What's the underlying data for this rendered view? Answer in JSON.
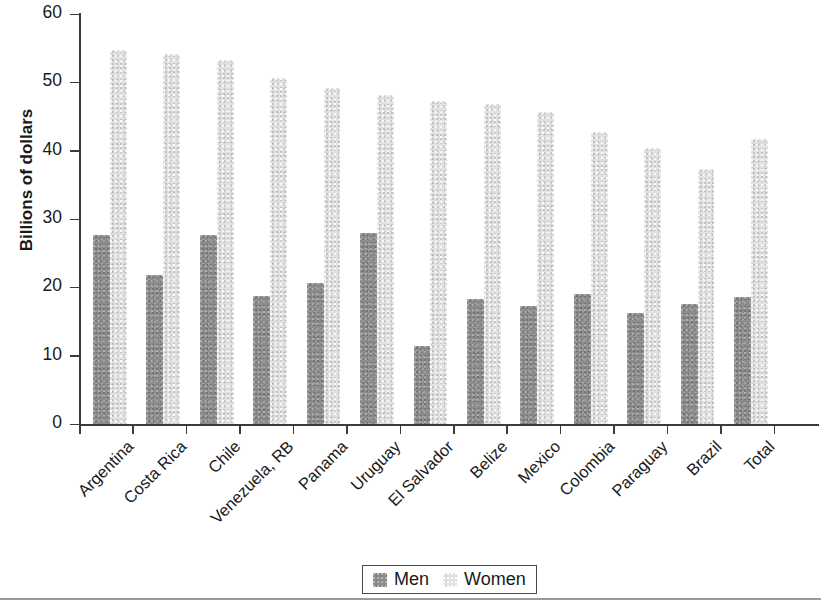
{
  "chart_data": {
    "type": "bar",
    "title": "",
    "xlabel": "",
    "ylabel": "Billions of dollars",
    "ylim": [
      0,
      60
    ],
    "yticks": [
      0,
      10,
      20,
      30,
      40,
      50,
      60
    ],
    "grid": false,
    "legend_position": "bottom",
    "categories": [
      "Argentina",
      "Costa Rica",
      "Chile",
      "Venezuela, RB",
      "Panama",
      "Uruguay",
      "El Salvador",
      "Belize",
      "Mexico",
      "Colombia",
      "Paraguay",
      "Brazil",
      "Total"
    ],
    "series": [
      {
        "name": "Men",
        "color": "#8c8c8c",
        "values": [
          27.6,
          21.8,
          27.6,
          18.8,
          20.7,
          28.0,
          11.4,
          18.3,
          17.3,
          19.0,
          16.2,
          17.5,
          18.6
        ]
      },
      {
        "name": "Women",
        "color": "#e2e2e2",
        "values": [
          54.7,
          54.1,
          53.2,
          50.7,
          49.1,
          48.1,
          47.2,
          46.9,
          45.6,
          42.7,
          40.4,
          37.3,
          41.7
        ]
      }
    ]
  },
  "axis": {
    "ylabel": "Billions of dollars",
    "tick_labels": [
      "0",
      "10",
      "20",
      "30",
      "40",
      "50",
      "60"
    ]
  },
  "legend": {
    "items": [
      {
        "label": "Men",
        "swatch": "men-swatch",
        "color": "#8c8c8c"
      },
      {
        "label": "Women",
        "swatch": "women-swatch",
        "color": "#e2e2e2"
      }
    ]
  }
}
